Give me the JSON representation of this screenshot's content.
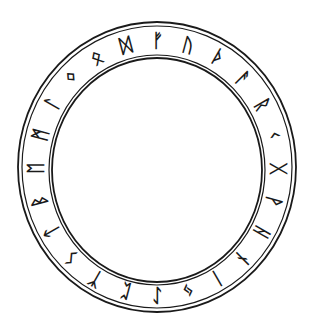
{
  "figure": {
    "ink_color": "#1a1a1a",
    "background": "#ffffff"
  },
  "ring": {
    "center": [
      157,
      167
    ],
    "outer_radius": [
      139,
      145
    ],
    "inner_radius": [
      105,
      113
    ],
    "rune_radius": [
      122,
      128
    ]
  },
  "runes": [
    {
      "glyph": "ᚠ",
      "name": "fehu",
      "angle": 0
    },
    {
      "glyph": "ᚢ",
      "name": "uruz",
      "angle": 15
    },
    {
      "glyph": "ᚦ",
      "name": "thurisaz",
      "angle": 30
    },
    {
      "glyph": "ᚨ",
      "name": "ansuz",
      "angle": 45
    },
    {
      "glyph": "ᚱ",
      "name": "raidho",
      "angle": 60
    },
    {
      "glyph": "ᚲ",
      "name": "kaunan",
      "angle": 75
    },
    {
      "glyph": "ᚷ",
      "name": "gebo",
      "angle": 90
    },
    {
      "glyph": "ᚹ",
      "name": "wunjo",
      "angle": 105
    },
    {
      "glyph": "ᚺ",
      "name": "hagalaz",
      "angle": 120
    },
    {
      "glyph": "ᚾ",
      "name": "naudiz",
      "angle": 135
    },
    {
      "glyph": "ᛁ",
      "name": "isaz",
      "angle": 150
    },
    {
      "glyph": "ᛃ",
      "name": "jera",
      "angle": 165
    },
    {
      "glyph": "ᛇ",
      "name": "eihwaz",
      "angle": 180
    },
    {
      "glyph": "ᛈ",
      "name": "perthro",
      "angle": 195
    },
    {
      "glyph": "ᛉ",
      "name": "algiz",
      "angle": 210
    },
    {
      "glyph": "ᛊ",
      "name": "sowilo",
      "angle": 225
    },
    {
      "glyph": "ᛏ",
      "name": "tiwaz",
      "angle": 240
    },
    {
      "glyph": "ᛒ",
      "name": "berkanan",
      "angle": 255
    },
    {
      "glyph": "ᛖ",
      "name": "ehwaz",
      "angle": 270
    },
    {
      "glyph": "ᛗ",
      "name": "mannaz",
      "angle": 285
    },
    {
      "glyph": "ᛚ",
      "name": "laguz",
      "angle": 300
    },
    {
      "glyph": "ᛜ",
      "name": "ingwaz",
      "angle": 315
    },
    {
      "glyph": "ᛟ",
      "name": "othala",
      "angle": 330
    },
    {
      "glyph": "ᛞ",
      "name": "dagaz",
      "angle": 345
    }
  ]
}
